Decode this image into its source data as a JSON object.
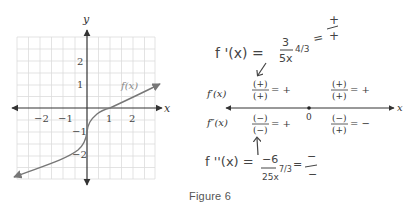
{
  "figure": {
    "caption": "Figure 6"
  },
  "graph": {
    "y_axis_label": "y",
    "x_axis_label": "x",
    "curve_label": "f(x)",
    "x_ticks": [
      "−2",
      "−1",
      "1",
      "2"
    ],
    "y_ticks": [
      "2",
      "1",
      "−1",
      "−2"
    ],
    "x_range": [
      -3,
      3
    ],
    "y_range": [
      -3,
      3
    ],
    "grid": true,
    "colors": {
      "curve": "#777777",
      "axis": "#333333",
      "grid": "#dddddd"
    }
  },
  "annotations": {
    "first_derivative": {
      "lhs": "f '(x) =",
      "numerator": "3",
      "denominator": "5x",
      "exponent": "4/3",
      "sign_result_num": "+",
      "sign_result_den": "+",
      "equals": "="
    },
    "second_derivative": {
      "lhs": "f ''(x) =",
      "numerator": "−6",
      "denominator": "25x",
      "exponent": "7/3",
      "sign_result_num": "−",
      "sign_result_den": "−",
      "equals": "="
    }
  },
  "sign_chart": {
    "axis_label": "x",
    "critical_point": "0",
    "rows": [
      {
        "label": "f′(x)",
        "left": {
          "numerator": "(+)",
          "denominator": "(+)",
          "result": "= +"
        },
        "right": {
          "numerator": "(+)",
          "denominator": "(+)",
          "result": "= +"
        }
      },
      {
        "label": "f″(x)",
        "left": {
          "numerator": "(−)",
          "denominator": "(−)",
          "result": "= +"
        },
        "right": {
          "numerator": "(−)",
          "denominator": "(+)",
          "result": "= −"
        }
      }
    ]
  }
}
